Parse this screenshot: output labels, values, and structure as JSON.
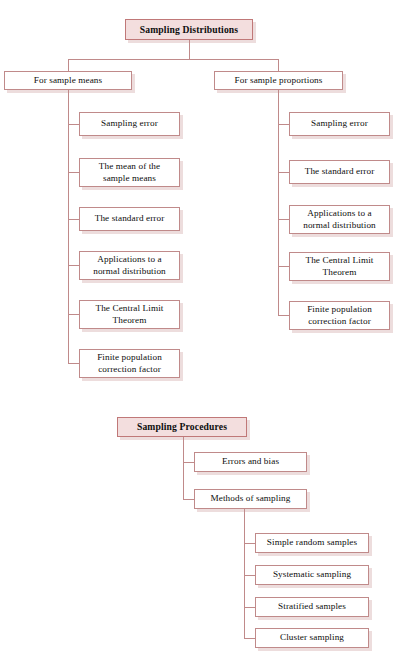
{
  "diagrams": [
    {
      "id": "sampling-distributions",
      "title": "Sampling Distributions",
      "branches": [
        {
          "id": "for-sample-means",
          "label": "For sample means",
          "children": [
            "Sampling error",
            "The mean of the\nsample means",
            "The standard error",
            "Applications to a\nnormal distribution",
            "The Central Limit\nTheorem",
            "Finite population\ncorrection factor"
          ]
        },
        {
          "id": "for-sample-proportions",
          "label": "For sample proportions",
          "children": [
            "Sampling error",
            "The standard error",
            "Applications to a\nnormal distribution",
            "The Central Limit\nTheorem",
            "Finite population\ncorrection factor"
          ]
        }
      ]
    },
    {
      "id": "sampling-procedures",
      "title": "Sampling Procedures",
      "branches": [
        {
          "id": "errors-and-bias",
          "label": "Errors and bias",
          "children": []
        },
        {
          "id": "methods-of-sampling",
          "label": "Methods of sampling",
          "children": [
            "Simple random samples",
            "Systematic sampling",
            "Stratified samples",
            "Cluster sampling"
          ]
        }
      ]
    }
  ],
  "colors": {
    "title_fill": "#f3dede",
    "border": "#c08a8a",
    "title_border": "#c07878",
    "shadow": "#d6b4b4",
    "text": "#0d0d0d",
    "background": "#ffffff"
  }
}
